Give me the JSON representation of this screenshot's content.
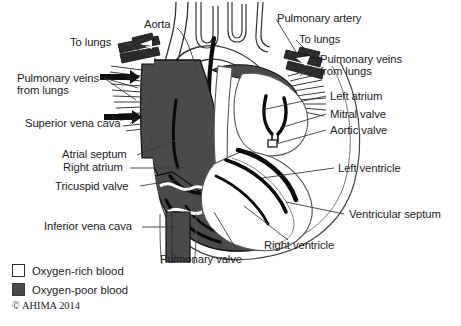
{
  "figure": {
    "colors": {
      "oxygen_poor_fill": "#4a4a4a",
      "oxygen_rich_fill": "#ffffff",
      "muscle_outline": "#000000",
      "leader_line": "#3a3a3a",
      "text": "#1c1c1c",
      "background": "#ffffff"
    }
  },
  "labels": {
    "aorta": "Aorta",
    "to_lungs_left": "To lungs",
    "pulmonary_veins_left": "Pulmonary veins\nfrom lungs",
    "pulmonary_veins_left_line1": "Pulmonary veins",
    "pulmonary_veins_left_line2": "from lungs",
    "superior_vena_cava": "Superior vena cava",
    "atrial_septum": "Atrial septum",
    "right_atrium": "Right atrium",
    "tricuspid_valve": "Tricuspid valve",
    "inferior_vena_cava": "Inferior vena cava",
    "pulmonary_artery": "Pulmonary artery",
    "to_lungs_right": "To lungs",
    "pulmonary_veins_right_line1": "Pulmonary veins",
    "pulmonary_veins_right_line2": "from lungs",
    "left_atrium": "Left atrium",
    "mitral_valve": "Mitral valve",
    "aortic_valve": "Aortic valve",
    "left_ventricle": "Left ventricle",
    "ventricular_septum": "Ventricular septum",
    "right_ventricle": "Right ventricle",
    "pulmonary_valve": "Pulmonary valve"
  },
  "legend": {
    "items": [
      {
        "swatch": "oxygen-rich",
        "label": "Oxygen-rich blood"
      },
      {
        "swatch": "oxygen-poor",
        "label": "Oxygen-poor blood"
      }
    ],
    "oxygen_rich_label": "Oxygen-rich blood",
    "oxygen_poor_label": "Oxygen-poor blood"
  },
  "copyright": "© AHIMA 2014"
}
